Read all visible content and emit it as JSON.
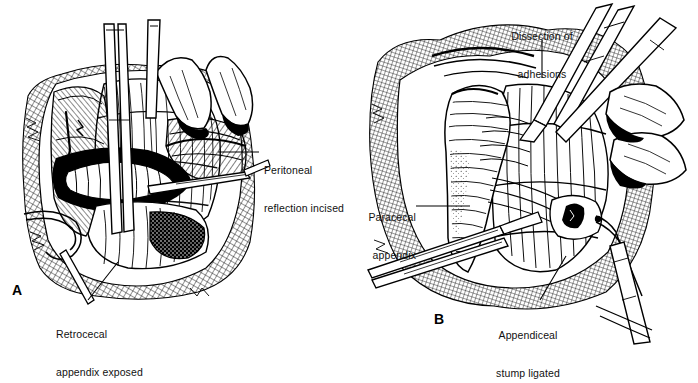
{
  "figure": {
    "background_color": "#ffffff",
    "ink_color": "#000000",
    "style": "pen-and-ink surgical line illustration with hatching, cross-hatching and stipple shading"
  },
  "panels": [
    {
      "id": "A",
      "letter": "A",
      "subject": "Retrocecal appendix exposed after incising the peritoneal reflection",
      "labels": [
        {
          "name": "peritoneal-reflection-incised",
          "line1": "Peritoneal",
          "line2": "reflection incised",
          "leader": "horizontal line from the lateral peritoneal edge rightward to the text"
        },
        {
          "name": "retrocecal-appendix-exposed",
          "line1": "Retrocecal",
          "line2": "appendix exposed",
          "leader": "line rising from the text up-right to the exposed appendix"
        }
      ]
    },
    {
      "id": "B",
      "letter": "B",
      "subject": "Dissection of adhesions with the paracecal appendix and ligated appendiceal stump",
      "labels": [
        {
          "name": "dissection-of-adhesions",
          "line1": "Dissection of",
          "line2": "adhesions",
          "leader": "vertical line descending from the text to the adhesion band"
        },
        {
          "name": "paracecal-appendix",
          "line1": "Paracecal",
          "line2": "appendix",
          "leader": "horizontal line from the text rightward to the appendix body"
        },
        {
          "name": "appendiceal-stump-ligated",
          "line1": "Appendiceal",
          "line2": "stump ligated",
          "leader": "line rising from the text up-right to the ligature on the stump"
        }
      ]
    }
  ]
}
